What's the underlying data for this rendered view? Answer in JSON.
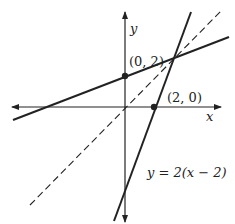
{
  "diagram": {
    "type": "coordinate-plane-lines",
    "axes": {
      "x_label": "x",
      "y_label": "y"
    },
    "points": [
      {
        "label": "(0, 2)",
        "x": 0,
        "y": 2
      },
      {
        "label": "(2, 0)",
        "x": 2,
        "y": 0
      }
    ],
    "lines": [
      {
        "name": "steep-line",
        "equation": "y = 2(x − 2)",
        "style": "solid"
      },
      {
        "name": "shallow-line",
        "passes_through": "(0, 2)",
        "style": "solid"
      },
      {
        "name": "diagonal-line",
        "equation_implied": "y = x",
        "style": "dashed"
      }
    ],
    "equation_label": "y = 2(x − 2)"
  }
}
